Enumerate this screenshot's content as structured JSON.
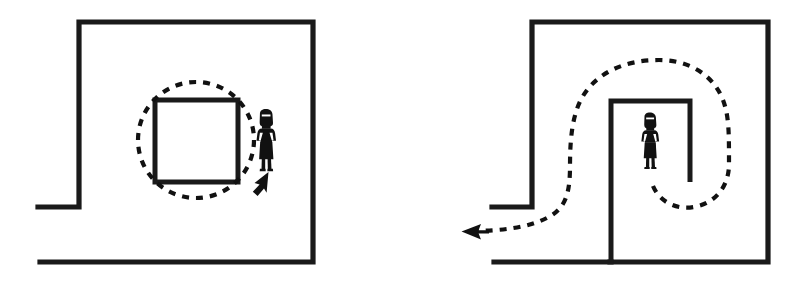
{
  "figure": {
    "background_color": "#ffffff",
    "ink_color": "#1a1a1a",
    "panels": [
      {
        "id": "left-panel",
        "name": "circular-route-panel",
        "description": "Room with a square obstacle in the centre; a person stands to the right of the obstacle and the dashed route loops in a complete circle around the obstacle, ending with an arrow pointing back up toward the person.",
        "route_type": "closed-loop-circle",
        "route_direction": "counter-clockwise-return",
        "arrow_direction": "up-right",
        "obstacle_shape": "square",
        "person_position": "right-of-obstacle",
        "doorway_side": "left"
      },
      {
        "id": "right-panel",
        "name": "exit-route-panel",
        "description": "Room with an inverted-U inner structure; the person stands inside the alcove and the dashed route spirals down out of the alcove, around the structure, and exits left through the doorway with an arrow pointing left.",
        "route_type": "open-spiral-exit",
        "route_direction": "clockwise-then-out",
        "arrow_direction": "left",
        "obstacle_shape": "inverted-u-alcove",
        "person_position": "inside-alcove",
        "doorway_side": "left"
      }
    ],
    "geometry": {
      "left": {
        "room_top_left": [
          79,
          22
        ],
        "room_bottom_right": [
          313,
          262
        ],
        "door_stub_x": [
          38,
          79
        ],
        "door_stub_y": 207,
        "obstacle_rect": [
          155,
          100,
          83,
          82
        ],
        "circle_center": [
          196,
          140
        ],
        "circle_radius": 58,
        "person_xy": [
          266,
          148
        ]
      },
      "right": {
        "room_top_left": [
          532,
          22
        ],
        "room_bottom_right": [
          768,
          262
        ],
        "door_stub_x": [
          492,
          532
        ],
        "door_stub_y": 207,
        "alcove_left_x": 611,
        "alcove_right_x": 690,
        "alcove_top_y": 101,
        "alcove_right_bottom_y": 182,
        "person_xy": [
          650,
          148
        ],
        "arrow_tip": [
          463,
          232
        ]
      }
    }
  }
}
